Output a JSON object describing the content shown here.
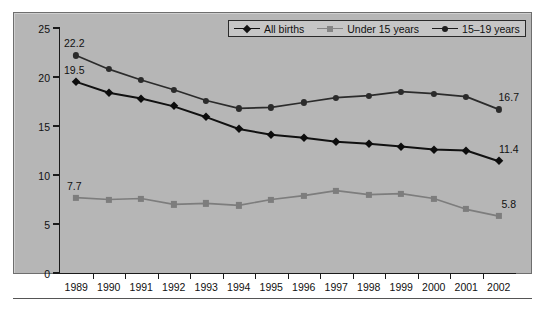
{
  "chart_data": {
    "type": "line",
    "title": "",
    "subtitle": "",
    "xlabel": "",
    "ylabel": "Percent",
    "categories": [
      "1989",
      "1990",
      "1991",
      "1992",
      "1993",
      "1994",
      "1995",
      "1996",
      "1997",
      "1998",
      "1999",
      "2000",
      "2001",
      "2002"
    ],
    "ylim": [
      0,
      25
    ],
    "y_ticks": [
      0,
      5,
      10,
      15,
      20,
      25
    ],
    "grid": false,
    "legend_position": "top-right",
    "series": [
      {
        "name": "All births",
        "color": "#111111",
        "marker": "diamond",
        "values": [
          19.5,
          18.4,
          17.8,
          17.0,
          15.9,
          14.7,
          14.1,
          13.8,
          13.4,
          13.2,
          12.9,
          12.6,
          12.5,
          11.4
        ],
        "start_label": "19.5",
        "end_label": "11.4"
      },
      {
        "name": "Under 15 years",
        "color": "#7d7d7d",
        "marker": "square",
        "values": [
          7.7,
          7.5,
          7.6,
          7.0,
          7.1,
          6.9,
          7.5,
          7.9,
          8.4,
          8.0,
          8.1,
          7.6,
          6.5,
          5.8
        ],
        "start_label": "7.7",
        "end_label": "5.8"
      },
      {
        "name": "15-19 years",
        "color": "#2b2b2b",
        "marker": "circle",
        "values": [
          22.2,
          20.8,
          19.7,
          18.7,
          17.6,
          16.8,
          16.9,
          17.4,
          17.9,
          18.1,
          18.5,
          18.3,
          18.0,
          16.7
        ],
        "start_label": "22.2",
        "end_label": "16.7"
      }
    ],
    "annotations": [
      {
        "text": "22.2",
        "series": "15-19 years",
        "at": "1989"
      },
      {
        "text": "19.5",
        "series": "All births",
        "at": "1989"
      },
      {
        "text": "7.7",
        "series": "Under 15 years",
        "at": "1989"
      },
      {
        "text": "16.7",
        "series": "15-19 years",
        "at": "2002"
      },
      {
        "text": "11.4",
        "series": "All births",
        "at": "2002"
      },
      {
        "text": "5.8",
        "series": "Under 15 years",
        "at": "2002"
      }
    ]
  },
  "legend": {
    "items": [
      {
        "label": "All births"
      },
      {
        "label": "Under 15 years"
      },
      {
        "label": "15–19 years"
      }
    ]
  },
  "axes": {
    "y_title": "Percent",
    "y_tick_labels": [
      "25",
      "20",
      "15",
      "10",
      "5",
      "0"
    ],
    "x_tick_labels": [
      "1989",
      "1990",
      "1991",
      "1992",
      "1993",
      "1994",
      "1995",
      "1996",
      "1997",
      "1998",
      "1999",
      "2000",
      "2001",
      "2002"
    ]
  },
  "colors": {
    "plot_background": "#b6b6b6",
    "frame_border": "#6e6e6e",
    "axis": "#1a1a1a",
    "series_all_births": "#111111",
    "series_under_15": "#7d7d7d",
    "series_15_19": "#2b2b2b",
    "legend_background": "#c6c6c6"
  }
}
